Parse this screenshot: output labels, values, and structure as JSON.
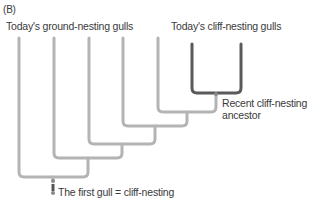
{
  "panel_label": "(B)",
  "labels": {
    "ground_nesting": "Today's ground-nesting gulls",
    "cliff_nesting": "Today's cliff-nesting gulls",
    "recent_ancestor_line1": "Recent cliff-nesting",
    "recent_ancestor_line2": "ancestor",
    "first_gull": "The first gull = cliff-nesting"
  },
  "tree": {
    "ground_nesting_lineages": 5,
    "cliff_nesting_lineages": 2,
    "colors": {
      "ground_branch": "#b4b4b4",
      "cliff_branch": "#5a5a5a",
      "node": "#8a8a8a",
      "state_change_marker": "#555555"
    }
  }
}
